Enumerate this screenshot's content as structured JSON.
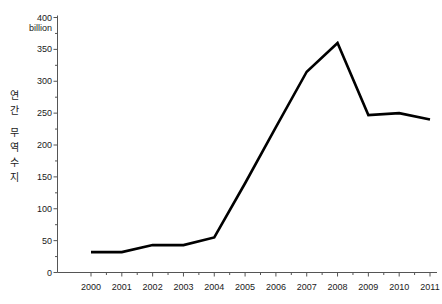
{
  "chart_data": {
    "type": "line",
    "title": "",
    "subtitle": "",
    "xlabel": "",
    "ylabel": "연간 무역수지",
    "ylabel_chars": [
      "연",
      "간",
      "무",
      "역",
      "수",
      "지"
    ],
    "unit_label": "billion",
    "x": [
      2000,
      2001,
      2002,
      2003,
      2004,
      2005,
      2006,
      2007,
      2008,
      2009,
      2010,
      2011
    ],
    "categories": [
      "2000",
      "2001",
      "2002",
      "2003",
      "2004",
      "2005",
      "2006",
      "2007",
      "2008",
      "2009",
      "2010",
      "2011"
    ],
    "values": [
      32,
      32,
      43,
      43,
      55,
      140,
      228,
      315,
      360,
      247,
      250,
      240
    ],
    "series": [
      {
        "name": "연간 무역수지",
        "values": [
          32,
          32,
          43,
          43,
          55,
          140,
          228,
          315,
          360,
          247,
          250,
          240
        ],
        "color": "#000000"
      }
    ],
    "ylim": [
      0,
      400
    ],
    "xlim": [
      2000,
      2011
    ],
    "yticks": [
      0,
      50,
      100,
      150,
      200,
      250,
      300,
      350,
      400
    ],
    "ytick_labels": [
      "0",
      "50",
      "100",
      "150",
      "200",
      "250",
      "300",
      "350",
      "400"
    ],
    "yminor_ticks": [
      25,
      75,
      125,
      175,
      225,
      275,
      325,
      375
    ],
    "xtick_labels": [
      "2000",
      "2001",
      "2002",
      "2003",
      "2004",
      "2005",
      "2006",
      "2007",
      "2008",
      "2009",
      "2010",
      "2011"
    ],
    "grid": false,
    "legend": false,
    "legend_position": "none",
    "line_width": 2.6,
    "axis_color": "#555555",
    "background_color": "#ffffff",
    "annotations": []
  }
}
